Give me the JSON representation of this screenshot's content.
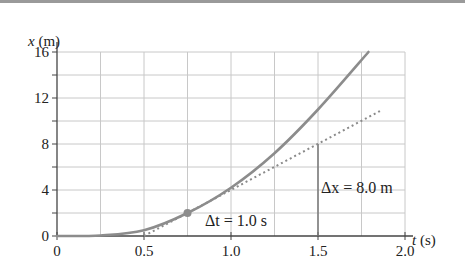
{
  "chart_data": {
    "type": "line",
    "title": "",
    "xlabel": "t (s)",
    "ylabel": "x (m)",
    "xlabel_var": "t",
    "xlabel_unit": "(s)",
    "ylabel_var": "x",
    "ylabel_unit": "(m)",
    "xlim": [
      0,
      2.0
    ],
    "ylim": [
      0,
      16
    ],
    "x_ticks": [
      "0",
      "0.5",
      "1.0",
      "1.5",
      "2.0"
    ],
    "y_ticks": [
      "0",
      "4",
      "8",
      "12",
      "16"
    ],
    "grid": true,
    "series": [
      {
        "name": "position curve",
        "style": "solid",
        "x": [
          0,
          0.25,
          0.5,
          0.75,
          1.0,
          1.25,
          1.5,
          1.79
        ],
        "y": [
          0,
          0.05,
          0.5,
          2.0,
          4.2,
          7.2,
          11.0,
          16.0
        ]
      },
      {
        "name": "tangent line at t = 0.75 s",
        "style": "dotted",
        "x": [
          0.5,
          1.86
        ],
        "y": [
          0,
          10.9
        ]
      }
    ],
    "marked_point": {
      "t": 0.75,
      "x": 2.0
    },
    "annotations": [
      {
        "text_var": "Δt",
        "text_value": "= 1.0 s",
        "t": 0.82,
        "x": 1.0
      },
      {
        "text_var": "Δx",
        "text_value": "= 8.0 m",
        "t": 1.52,
        "x": 5.5
      }
    ],
    "delta_line": {
      "t": 1.5,
      "x_from": 0,
      "x_to": 8
    }
  }
}
